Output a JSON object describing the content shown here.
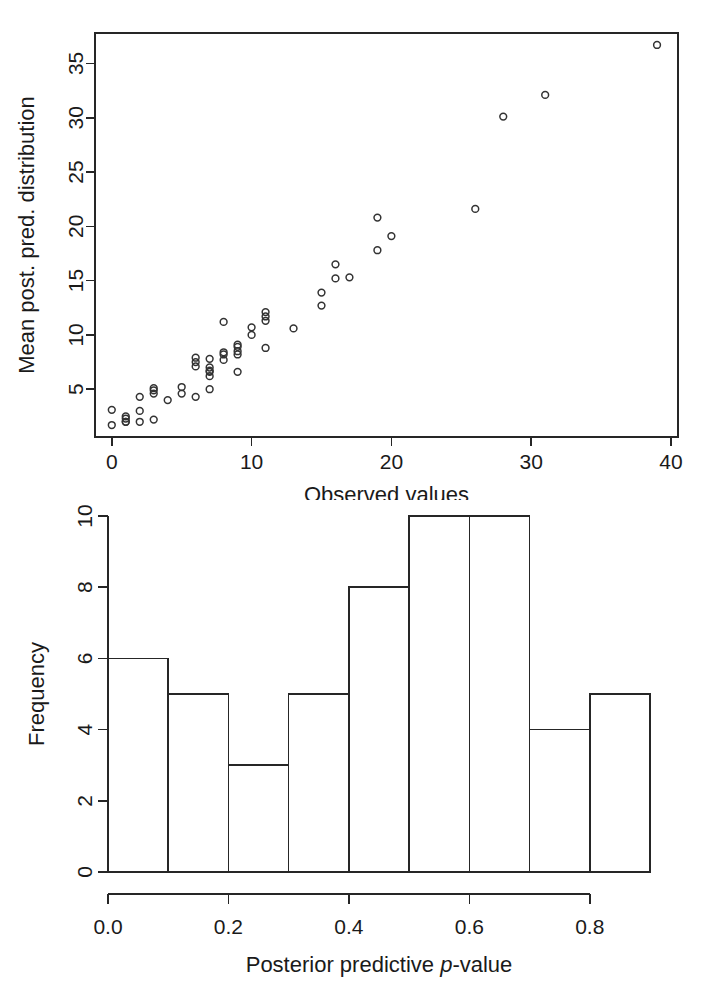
{
  "figure": {
    "name": "posterior-predictive-check-figure",
    "panel_count": 2
  },
  "chart_data": [
    {
      "id": "scatter-panel",
      "type": "scatter",
      "title": "",
      "xlabel": "Observed values",
      "ylabel": "Mean post. pred. distribution",
      "xlim": [
        -1.2,
        40.5
      ],
      "ylim": [
        0.6,
        37.8
      ],
      "xticks": [
        0,
        10,
        20,
        30,
        40
      ],
      "xticklabels": [
        "0",
        "10",
        "20",
        "30",
        "40"
      ],
      "yticks": [
        5,
        10,
        15,
        20,
        25,
        30,
        35
      ],
      "yticklabels": [
        "5",
        "10",
        "15",
        "20",
        "25",
        "30",
        "35"
      ],
      "grid": false,
      "legend": "none",
      "marker": "open-circle",
      "box": true,
      "points": [
        {
          "x": 0,
          "y": 3.1
        },
        {
          "x": 0,
          "y": 1.7
        },
        {
          "x": 1,
          "y": 2.3
        },
        {
          "x": 1,
          "y": 2.5
        },
        {
          "x": 1,
          "y": 2.0
        },
        {
          "x": 1,
          "y": 2.0
        },
        {
          "x": 2,
          "y": 3.0
        },
        {
          "x": 2,
          "y": 2.0
        },
        {
          "x": 2,
          "y": 4.3
        },
        {
          "x": 3,
          "y": 5.1
        },
        {
          "x": 3,
          "y": 4.9
        },
        {
          "x": 3,
          "y": 4.6
        },
        {
          "x": 3,
          "y": 2.2
        },
        {
          "x": 4,
          "y": 4.0
        },
        {
          "x": 5,
          "y": 5.2
        },
        {
          "x": 5,
          "y": 4.6
        },
        {
          "x": 6,
          "y": 7.9
        },
        {
          "x": 6,
          "y": 7.5
        },
        {
          "x": 6,
          "y": 7.1
        },
        {
          "x": 6,
          "y": 4.3
        },
        {
          "x": 7,
          "y": 7.8
        },
        {
          "x": 7,
          "y": 7.0
        },
        {
          "x": 7,
          "y": 6.7
        },
        {
          "x": 7,
          "y": 6.6
        },
        {
          "x": 7,
          "y": 6.2
        },
        {
          "x": 7,
          "y": 5.0
        },
        {
          "x": 8,
          "y": 11.2
        },
        {
          "x": 8,
          "y": 8.4
        },
        {
          "x": 8,
          "y": 8.2
        },
        {
          "x": 8,
          "y": 7.7
        },
        {
          "x": 9,
          "y": 9.1
        },
        {
          "x": 9,
          "y": 8.9
        },
        {
          "x": 9,
          "y": 8.5
        },
        {
          "x": 9,
          "y": 8.2
        },
        {
          "x": 9,
          "y": 6.6
        },
        {
          "x": 10,
          "y": 10.7
        },
        {
          "x": 10,
          "y": 10.0
        },
        {
          "x": 11,
          "y": 12.1
        },
        {
          "x": 11,
          "y": 11.7
        },
        {
          "x": 11,
          "y": 11.3
        },
        {
          "x": 11,
          "y": 8.8
        },
        {
          "x": 13,
          "y": 10.6
        },
        {
          "x": 15,
          "y": 13.9
        },
        {
          "x": 15,
          "y": 12.7
        },
        {
          "x": 16,
          "y": 16.5
        },
        {
          "x": 16,
          "y": 15.2
        },
        {
          "x": 17,
          "y": 15.3
        },
        {
          "x": 19,
          "y": 20.8
        },
        {
          "x": 19,
          "y": 17.8
        },
        {
          "x": 20,
          "y": 19.1
        },
        {
          "x": 26,
          "y": 21.6
        },
        {
          "x": 28,
          "y": 30.1
        },
        {
          "x": 31,
          "y": 32.1
        },
        {
          "x": 39,
          "y": 36.7
        }
      ]
    },
    {
      "id": "histogram-panel",
      "type": "bar",
      "title": "",
      "xlabel_parts": [
        "Posterior predictive ",
        "p",
        "-value"
      ],
      "xlabel": "Posterior predictive p-value",
      "ylabel": "Frequency",
      "xlim": [
        0.0,
        0.9
      ],
      "ylim": [
        0,
        10
      ],
      "xticks": [
        0.0,
        0.2,
        0.4,
        0.6,
        0.8
      ],
      "xticklabels": [
        "0.0",
        "0.2",
        "0.4",
        "0.6",
        "0.8"
      ],
      "yticks": [
        0,
        2,
        4,
        6,
        8,
        10
      ],
      "yticklabels": [
        "0",
        "2",
        "4",
        "6",
        "8",
        "10"
      ],
      "grid": false,
      "legend": "none",
      "bin_width": 0.1,
      "bin_edges": [
        0.0,
        0.1,
        0.2,
        0.3,
        0.4,
        0.5,
        0.6,
        0.7,
        0.8,
        0.9
      ],
      "categories": [
        "0.0-0.1",
        "0.1-0.2",
        "0.2-0.3",
        "0.3-0.4",
        "0.4-0.5",
        "0.5-0.6",
        "0.6-0.7",
        "0.7-0.8",
        "0.8-0.9"
      ],
      "values": [
        6,
        5,
        3,
        5,
        8,
        10,
        10,
        4,
        5
      ]
    }
  ],
  "colors": {
    "ink": "#1a1a1a",
    "line": "#262626",
    "marker_stroke": "#333333",
    "background": "#ffffff"
  }
}
